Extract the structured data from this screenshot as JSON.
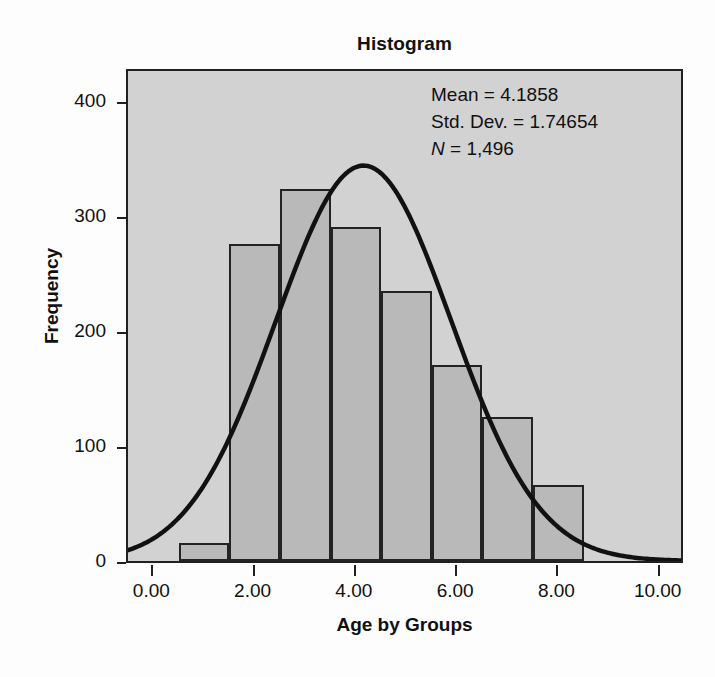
{
  "chart_data": {
    "type": "bar",
    "title": "Histogram",
    "xlabel": "Age by Groups",
    "ylabel": "Frequency",
    "xlim": [
      -0.5,
      10.5
    ],
    "ylim": [
      0,
      430
    ],
    "grid": false,
    "legend": null,
    "bin_width": 1.0,
    "bin_starts": [
      0.5,
      1.5,
      2.5,
      3.5,
      4.5,
      5.5,
      6.5,
      7.5
    ],
    "categories": [
      "0.5-1.5",
      "1.5-2.5",
      "2.5-3.5",
      "3.5-4.5",
      "4.5-5.5",
      "5.5-6.5",
      "6.5-7.5",
      "7.5-8.5"
    ],
    "values": [
      16,
      276,
      324,
      291,
      235,
      171,
      125,
      66
    ],
    "xticks": [
      0,
      2,
      4,
      6,
      8,
      10
    ],
    "xtick_labels": [
      "0.00",
      "2.00",
      "4.00",
      "6.00",
      "8.00",
      "10.00"
    ],
    "yticks": [
      0,
      100,
      200,
      300,
      400
    ],
    "ytick_labels": [
      "0",
      "100",
      "200",
      "300",
      "400"
    ],
    "overlay": {
      "type": "normal-curve",
      "mean": 4.1858,
      "std_dev": 1.74654,
      "n": 1496,
      "peak_value": 347
    },
    "annotations": {
      "mean_label": "Mean = 4.1858",
      "std_dev_label": "Std. Dev. = 1.74654",
      "n_symbol": "N",
      "n_value_label": " = 1,496"
    },
    "colors": {
      "bar_fill": "#b9b9b9",
      "bar_edge": "#232323",
      "plot_background": "#d2d2d2",
      "curve": "#111111",
      "frame": "#20201f",
      "text": "#101010"
    }
  }
}
